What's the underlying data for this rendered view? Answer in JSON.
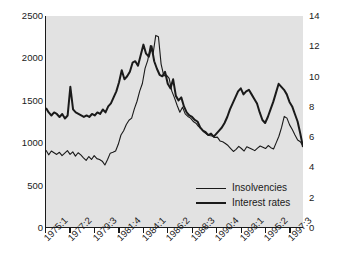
{
  "chart_data": {
    "type": "line",
    "title": "",
    "xlabel": "",
    "ylabel": "",
    "grid": false,
    "legend_position": "inside-bottom-right",
    "plot_background": "#e2e2e2",
    "line_color": "#1a1a1a",
    "x_tick_labels": [
      "1975:1",
      "1977:2",
      "1979:3",
      "1981:4",
      "1984:1",
      "1986:2",
      "1988:3",
      "1990:4",
      "1993:1",
      "1995:2",
      "1997:3"
    ],
    "x_tick_quarter_index": [
      0,
      9,
      18,
      27,
      36,
      45,
      54,
      63,
      72,
      81,
      90
    ],
    "x_range_quarters": [
      0,
      95
    ],
    "left_axis": {
      "label": "Insolvencies",
      "ticks": [
        0,
        500,
        1000,
        1500,
        2000,
        2500
      ],
      "ylim": [
        0,
        2500
      ]
    },
    "right_axis": {
      "label": "Interest rates",
      "ticks": [
        0,
        2,
        4,
        6,
        8,
        10,
        12,
        14
      ],
      "ylim": [
        0,
        14
      ]
    },
    "series": [
      {
        "name": "Insolvencies",
        "axis": "left",
        "line_width": 1.1,
        "values": [
          910,
          855,
          900,
          880,
          860,
          885,
          845,
          875,
          905,
          860,
          890,
          840,
          880,
          855,
          820,
          790,
          835,
          800,
          845,
          810,
          800,
          780,
          735,
          800,
          875,
          885,
          900,
          980,
          1090,
          1140,
          1215,
          1265,
          1290,
          1400,
          1490,
          1610,
          1700,
          1880,
          1975,
          2150,
          2055,
          2270,
          2255,
          1930,
          1790,
          1800,
          1760,
          1610,
          1530,
          1440,
          1360,
          1420,
          1340,
          1310,
          1290,
          1250,
          1230,
          1190,
          1165,
          1125,
          1100,
          1085,
          1080,
          1060,
          1065,
          1020,
          1010,
          990,
          965,
          930,
          895,
          920,
          955,
          930,
          900,
          950,
          935,
          920,
          905,
          935,
          960,
          945,
          930,
          965,
          940,
          925,
          1000,
          1075,
          1180,
          1310,
          1290,
          1210,
          1155,
          1090,
          1030,
          1010,
          960
        ]
      },
      {
        "name": "Interest rates",
        "axis": "right",
        "line_width": 2.0,
        "values": [
          7.9,
          7.6,
          7.4,
          7.6,
          7.5,
          7.3,
          7.5,
          7.2,
          7.4,
          9.3,
          7.8,
          7.6,
          7.5,
          7.4,
          7.3,
          7.4,
          7.3,
          7.5,
          7.4,
          7.6,
          7.5,
          7.8,
          7.6,
          8.0,
          8.2,
          8.6,
          9.0,
          9.6,
          10.4,
          9.8,
          10.0,
          10.3,
          10.9,
          11.0,
          10.7,
          11.4,
          12.1,
          11.5,
          11.3,
          12.0,
          11.0,
          10.5,
          10.1,
          10.0,
          10.3,
          9.5,
          9.2,
          9.8,
          8.7,
          8.4,
          8.6,
          8.0,
          7.6,
          7.4,
          7.3,
          7.1,
          7.0,
          6.6,
          6.4,
          6.3,
          6.1,
          6.2,
          6.0,
          6.2,
          6.4,
          6.6,
          6.9,
          7.3,
          7.8,
          8.2,
          8.6,
          9.0,
          9.2,
          8.8,
          9.0,
          9.1,
          8.8,
          8.5,
          8.2,
          7.6,
          7.1,
          6.9,
          7.3,
          7.8,
          8.3,
          8.9,
          9.5,
          9.3,
          9.1,
          8.8,
          8.3,
          8.0,
          7.5,
          7.0,
          6.2,
          5.3
        ]
      }
    ]
  }
}
